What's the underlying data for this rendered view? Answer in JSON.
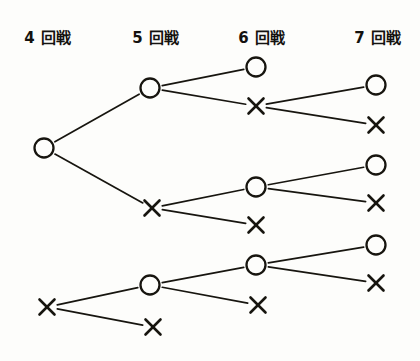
{
  "figure": {
    "kind": "tournament-progression-tree",
    "title": "",
    "background_color": "#fdfdfb",
    "ink_color": "#17150f"
  },
  "columns": [
    {
      "id": "round4",
      "label": "4 回戦",
      "x": 48,
      "header_y": 36
    },
    {
      "id": "round5",
      "label": "5 回戦",
      "x": 156,
      "header_y": 36
    },
    {
      "id": "round6",
      "label": "6 回戦",
      "x": 262,
      "header_y": 36
    },
    {
      "id": "round7",
      "label": "7 回戦",
      "x": 378,
      "header_y": 36
    }
  ],
  "nodes": [
    {
      "id": "n4a",
      "column": "round4",
      "symbol": "circle",
      "x": 44,
      "y": 148
    },
    {
      "id": "n4b",
      "column": "round4",
      "symbol": "cross",
      "x": 47,
      "y": 307
    },
    {
      "id": "n5a",
      "column": "round5",
      "symbol": "circle",
      "x": 150,
      "y": 88
    },
    {
      "id": "n5b",
      "column": "round5",
      "symbol": "cross",
      "x": 152,
      "y": 208
    },
    {
      "id": "n5c",
      "column": "round5",
      "symbol": "circle",
      "x": 150,
      "y": 285
    },
    {
      "id": "n5d",
      "column": "round5",
      "symbol": "cross",
      "x": 153,
      "y": 327
    },
    {
      "id": "n6a",
      "column": "round6",
      "symbol": "circle",
      "x": 256,
      "y": 67
    },
    {
      "id": "n6b",
      "column": "round6",
      "symbol": "cross",
      "x": 256,
      "y": 106
    },
    {
      "id": "n6c",
      "column": "round6",
      "symbol": "circle",
      "x": 256,
      "y": 187
    },
    {
      "id": "n6d",
      "column": "round6",
      "symbol": "cross",
      "x": 256,
      "y": 225
    },
    {
      "id": "n6e",
      "column": "round6",
      "symbol": "circle",
      "x": 256,
      "y": 265
    },
    {
      "id": "n6f",
      "column": "round6",
      "symbol": "cross",
      "x": 258,
      "y": 305
    },
    {
      "id": "n7a",
      "column": "round7",
      "symbol": "circle",
      "x": 376,
      "y": 85
    },
    {
      "id": "n7b",
      "column": "round7",
      "symbol": "cross",
      "x": 376,
      "y": 125
    },
    {
      "id": "n7c",
      "column": "round7",
      "symbol": "circle",
      "x": 376,
      "y": 165
    },
    {
      "id": "n7d",
      "column": "round7",
      "symbol": "cross",
      "x": 376,
      "y": 203
    },
    {
      "id": "n7e",
      "column": "round7",
      "symbol": "circle",
      "x": 376,
      "y": 245
    },
    {
      "id": "n7f",
      "column": "round7",
      "symbol": "cross",
      "x": 376,
      "y": 283
    }
  ],
  "edges": [
    {
      "from": "n4a",
      "to": "n5a"
    },
    {
      "from": "n4a",
      "to": "n5b"
    },
    {
      "from": "n5a",
      "to": "n6a"
    },
    {
      "from": "n5a",
      "to": "n6b"
    },
    {
      "from": "n6b",
      "to": "n7a"
    },
    {
      "from": "n6b",
      "to": "n7b"
    },
    {
      "from": "n5b",
      "to": "n6c"
    },
    {
      "from": "n5b",
      "to": "n6d"
    },
    {
      "from": "n6c",
      "to": "n7c"
    },
    {
      "from": "n6c",
      "to": "n7d"
    },
    {
      "from": "n4b",
      "to": "n5c"
    },
    {
      "from": "n4b",
      "to": "n5d"
    },
    {
      "from": "n5c",
      "to": "n6e"
    },
    {
      "from": "n5c",
      "to": "n6f"
    },
    {
      "from": "n6e",
      "to": "n7e"
    },
    {
      "from": "n6e",
      "to": "n7f"
    }
  ],
  "geometry": {
    "circle_radius": 9.5,
    "cross_half": 7.5,
    "node_gap": 3.0
  }
}
